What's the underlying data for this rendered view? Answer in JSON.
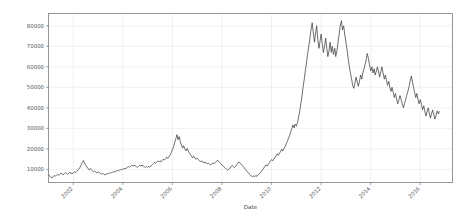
{
  "chart_data": {
    "type": "line",
    "title": "",
    "xlabel": "Date",
    "ylabel": "",
    "grid": true,
    "legend": null,
    "line_color": "#3d3d3d",
    "background_color": "#ffffff",
    "grid_color": "#e8e8e8",
    "axis_color": "#8a8a8a",
    "xlim": [
      2001.0,
      2017.3
    ],
    "ylim": [
      3600,
      86000
    ],
    "yticks": [
      10000,
      20000,
      30000,
      40000,
      50000,
      60000,
      70000,
      80000
    ],
    "ytick_labels": [
      "10000",
      "20000",
      "30000",
      "40000",
      "50000",
      "60000",
      "70000",
      "80000"
    ],
    "xticks": [
      2002,
      2004,
      2006,
      2008,
      2010,
      2012,
      2014,
      2016
    ],
    "xtick_labels": [
      "2002",
      "2004",
      "2006",
      "2008",
      "2010",
      "2012",
      "2014",
      "2016"
    ],
    "xtick_rotation": 45,
    "x": [
      2001.0,
      2001.05,
      2001.09,
      2001.14,
      2001.18,
      2001.23,
      2001.27,
      2001.32,
      2001.36,
      2001.41,
      2001.45,
      2001.5,
      2001.55,
      2001.59,
      2001.64,
      2001.68,
      2001.73,
      2001.77,
      2001.82,
      2001.86,
      2001.91,
      2001.95,
      2002.0,
      2002.05,
      2002.09,
      2002.14,
      2002.18,
      2002.23,
      2002.27,
      2002.32,
      2002.36,
      2002.41,
      2002.45,
      2002.5,
      2002.55,
      2002.59,
      2002.64,
      2002.68,
      2002.73,
      2002.77,
      2002.82,
      2002.86,
      2002.91,
      2002.95,
      2003.0,
      2003.05,
      2003.09,
      2003.14,
      2003.18,
      2003.23,
      2003.27,
      2003.32,
      2003.36,
      2003.41,
      2003.45,
      2003.5,
      2003.55,
      2003.59,
      2003.64,
      2003.68,
      2003.73,
      2003.77,
      2003.82,
      2003.86,
      2003.91,
      2003.95,
      2004.0,
      2004.05,
      2004.09,
      2004.14,
      2004.18,
      2004.23,
      2004.27,
      2004.32,
      2004.36,
      2004.41,
      2004.45,
      2004.5,
      2004.55,
      2004.59,
      2004.64,
      2004.68,
      2004.73,
      2004.77,
      2004.82,
      2004.86,
      2004.91,
      2004.95,
      2005.0,
      2005.05,
      2005.09,
      2005.14,
      2005.18,
      2005.23,
      2005.27,
      2005.32,
      2005.36,
      2005.41,
      2005.45,
      2005.5,
      2005.55,
      2005.59,
      2005.64,
      2005.68,
      2005.73,
      2005.77,
      2005.82,
      2005.86,
      2005.91,
      2005.95,
      2006.0,
      2006.05,
      2006.09,
      2006.14,
      2006.18,
      2006.23,
      2006.27,
      2006.32,
      2006.36,
      2006.41,
      2006.45,
      2006.5,
      2006.55,
      2006.59,
      2006.64,
      2006.68,
      2006.73,
      2006.77,
      2006.82,
      2006.86,
      2006.91,
      2006.95,
      2007.0,
      2007.05,
      2007.09,
      2007.14,
      2007.18,
      2007.23,
      2007.27,
      2007.32,
      2007.36,
      2007.41,
      2007.45,
      2007.5,
      2007.55,
      2007.59,
      2007.64,
      2007.68,
      2007.73,
      2007.77,
      2007.82,
      2007.86,
      2007.91,
      2007.95,
      2008.0,
      2008.05,
      2008.09,
      2008.14,
      2008.18,
      2008.23,
      2008.27,
      2008.32,
      2008.36,
      2008.41,
      2008.45,
      2008.5,
      2008.55,
      2008.59,
      2008.64,
      2008.68,
      2008.73,
      2008.77,
      2008.82,
      2008.86,
      2008.91,
      2008.95,
      2009.0,
      2009.05,
      2009.09,
      2009.14,
      2009.18,
      2009.23,
      2009.27,
      2009.32,
      2009.36,
      2009.41,
      2009.45,
      2009.5,
      2009.55,
      2009.59,
      2009.64,
      2009.68,
      2009.73,
      2009.77,
      2009.82,
      2009.86,
      2009.91,
      2009.95,
      2010.0,
      2010.05,
      2010.09,
      2010.14,
      2010.18,
      2010.23,
      2010.27,
      2010.32,
      2010.36,
      2010.41,
      2010.45,
      2010.5,
      2010.55,
      2010.59,
      2010.64,
      2010.68,
      2010.73,
      2010.77,
      2010.82,
      2010.86,
      2010.91,
      2010.95,
      2011.0,
      2011.05,
      2011.09,
      2011.14,
      2011.18,
      2011.23,
      2011.27,
      2011.32,
      2011.36,
      2011.41,
      2011.45,
      2011.5,
      2011.55,
      2011.59,
      2011.64,
      2011.68,
      2011.73,
      2011.77,
      2011.82,
      2011.86,
      2011.91,
      2011.95,
      2012.0,
      2012.05,
      2012.09,
      2012.14,
      2012.18,
      2012.23,
      2012.27,
      2012.32,
      2012.36,
      2012.41,
      2012.45,
      2012.5,
      2012.55,
      2012.59,
      2012.64,
      2012.68,
      2012.73,
      2012.77,
      2012.82,
      2012.86,
      2012.91,
      2012.95,
      2013.0,
      2013.05,
      2013.09,
      2013.14,
      2013.18,
      2013.23,
      2013.27,
      2013.32,
      2013.36,
      2013.41,
      2013.45,
      2013.5,
      2013.55,
      2013.59,
      2013.64,
      2013.68,
      2013.73,
      2013.77,
      2013.82,
      2013.86,
      2013.91,
      2013.95,
      2014.0,
      2014.05,
      2014.09,
      2014.14,
      2014.18,
      2014.23,
      2014.27,
      2014.32,
      2014.36,
      2014.41,
      2014.45,
      2014.5,
      2014.55,
      2014.59,
      2014.64,
      2014.68,
      2014.73,
      2014.77,
      2014.82,
      2014.86,
      2014.91,
      2014.95,
      2015.0,
      2015.05,
      2015.09,
      2015.14,
      2015.18,
      2015.23,
      2015.27,
      2015.32,
      2015.36,
      2015.41,
      2015.45,
      2015.5,
      2015.55,
      2015.59,
      2015.64,
      2015.68,
      2015.73,
      2015.77,
      2015.82,
      2015.86,
      2015.91,
      2015.95,
      2016.0,
      2016.05,
      2016.09,
      2016.14,
      2016.18,
      2016.23,
      2016.27,
      2016.32,
      2016.36,
      2016.41,
      2016.45,
      2016.5,
      2016.55,
      2016.59,
      2016.64,
      2016.68,
      2016.73,
      2016.77,
      2016.82,
      2016.86,
      2016.91,
      2016.95,
      2017.0,
      2017.05,
      2017.1,
      2017.15,
      2017.2,
      2017.25
    ],
    "y": [
      7400,
      6700,
      6200,
      5800,
      6400,
      7000,
      6600,
      7200,
      7600,
      7100,
      7500,
      8200,
      7800,
      7400,
      7900,
      8400,
      8000,
      7600,
      8100,
      8600,
      8200,
      7800,
      8300,
      8900,
      8500,
      9000,
      9600,
      10200,
      11000,
      12200,
      13400,
      14300,
      13200,
      12000,
      11200,
      10400,
      9800,
      10400,
      9900,
      9300,
      8800,
      9200,
      8700,
      8300,
      8800,
      8400,
      8000,
      7600,
      8000,
      7700,
      7300,
      7600,
      8000,
      7700,
      8100,
      8500,
      8200,
      8600,
      9000,
      8700,
      9100,
      9500,
      9200,
      9600,
      10000,
      9700,
      10100,
      10500,
      10200,
      10600,
      11000,
      11400,
      11000,
      11500,
      12000,
      11600,
      12100,
      11700,
      11300,
      11000,
      11500,
      12000,
      11600,
      12100,
      11700,
      11300,
      11000,
      11400,
      11000,
      11500,
      11100,
      11600,
      12200,
      12800,
      13400,
      12900,
      13500,
      14100,
      13600,
      14200,
      13700,
      14300,
      15000,
      14500,
      15200,
      16000,
      15400,
      16200,
      17000,
      18200,
      19600,
      21200,
      23000,
      25000,
      26900,
      24500,
      26000,
      23500,
      21800,
      20400,
      21600,
      20000,
      19000,
      20200,
      19000,
      18000,
      17200,
      16400,
      15600,
      16400,
      15600,
      14900,
      15500,
      14800,
      14200,
      13600,
      14200,
      13600,
      13100,
      13600,
      13100,
      12600,
      13100,
      12600,
      12100,
      12600,
      13200,
      12700,
      13300,
      13900,
      14500,
      13900,
      13300,
      12700,
      12100,
      11600,
      11100,
      10600,
      10100,
      9600,
      10000,
      10500,
      11200,
      12000,
      11400,
      10800,
      11500,
      12200,
      13000,
      13700,
      13100,
      12500,
      11900,
      11300,
      10600,
      9900,
      9200,
      8500,
      7900,
      7300,
      6800,
      6300,
      6900,
      6400,
      7000,
      6600,
      7200,
      7800,
      8400,
      9100,
      9800,
      10600,
      11400,
      12200,
      11600,
      12400,
      13200,
      14000,
      14800,
      14200,
      15000,
      15800,
      16600,
      17600,
      16800,
      17800,
      18800,
      19800,
      18900,
      20000,
      21200,
      22400,
      23700,
      25100,
      26600,
      28200,
      29900,
      31700,
      30200,
      32000,
      31000,
      33000,
      35500,
      38500,
      42000,
      46000,
      50000,
      54000,
      58000,
      62000,
      66000,
      70000,
      74000,
      78000,
      81500,
      77000,
      72000,
      76000,
      80000,
      74000,
      69000,
      72000,
      76000,
      71000,
      67000,
      70000,
      74000,
      69000,
      65000,
      68000,
      72000,
      67000,
      70000,
      66000,
      69000,
      65000,
      68000,
      72000,
      76000,
      80000,
      82500,
      78000,
      80000,
      76000,
      72000,
      68000,
      64000,
      60000,
      57000,
      54000,
      51000,
      49500,
      52000,
      55000,
      53000,
      50500,
      53000,
      56000,
      54000,
      57000,
      59000,
      61000,
      63500,
      66500,
      64000,
      61000,
      58000,
      60000,
      57000,
      59000,
      56000,
      58000,
      60000,
      57500,
      55000,
      57500,
      60000,
      57000,
      54000,
      56000,
      53000,
      51000,
      53000,
      50000,
      48000,
      50000,
      47500,
      45000,
      47000,
      44000,
      42000,
      44000,
      46000,
      44000,
      42000,
      40000,
      42000,
      44000,
      46000,
      48000,
      50500,
      53000,
      55500,
      53000,
      50000,
      47500,
      45000,
      47000,
      44000,
      42000,
      44000,
      41500,
      39000,
      41000,
      38500,
      36000,
      38000,
      40000,
      37500,
      35000,
      37000,
      39000,
      36500,
      34500,
      36500,
      38500,
      37000,
      38200
    ],
    "annotations": []
  }
}
